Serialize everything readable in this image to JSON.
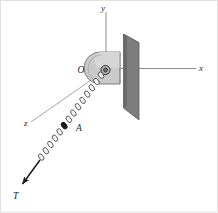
{
  "figure": {
    "background_color": "#ffffff",
    "border_color": "#d8d8d8"
  },
  "axes": {
    "x": {
      "label": "x",
      "color": "#8c8c8c",
      "from": [
        108,
        68
      ],
      "to": [
        196,
        68
      ]
    },
    "y": {
      "label": "y",
      "color": "#8c8c8c",
      "from": [
        106,
        68
      ],
      "to": [
        106,
        12
      ]
    },
    "z": {
      "label": "z",
      "color": "#8c8c8c",
      "from": [
        104,
        70
      ],
      "to": [
        31,
        122
      ]
    }
  },
  "origin": {
    "label": "O",
    "label_pos": [
      81,
      71
    ],
    "point": [
      106,
      70
    ]
  },
  "plate": {
    "name": "mounting-plate",
    "fill": "#7f7f7f",
    "edge": "#4a4a4a",
    "points": "124,35 138,42 138,119 124,107"
  },
  "bracket": {
    "name": "bracket-block",
    "fill": "#c3c3c3",
    "edge": "#6e6e6e",
    "top_fill": "#d2d2d2"
  },
  "hinge": {
    "name": "hinge-pin",
    "fill": "#9a9a9a",
    "edge": "#3a3a3a",
    "center": [
      105,
      70
    ],
    "radius": 3.4
  },
  "chain": {
    "name": "chain",
    "link_color": "#4b4b4b",
    "link_fill": "#f4f4f4",
    "start": [
      104,
      72
    ],
    "end": [
      26,
      178
    ],
    "link_count": 17
  },
  "collar": {
    "label": "A",
    "label_pos": [
      75,
      128
    ],
    "marker_center": [
      64,
      124
    ],
    "fill": "#1a1a1a"
  },
  "force": {
    "label": "T",
    "label_pos": [
      15,
      196
    ],
    "arrow_from": [
      40,
      162
    ],
    "arrow_to": [
      21,
      186
    ],
    "color": "#1c1c1c"
  }
}
